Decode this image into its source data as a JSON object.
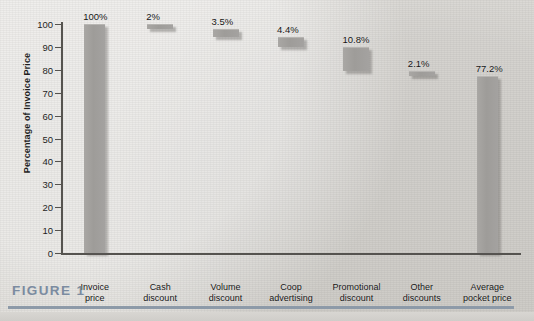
{
  "figure": {
    "caption": "FIGURE 1"
  },
  "chart_data": {
    "type": "bar",
    "title": "",
    "subtitle": "",
    "xlabel": "",
    "ylabel": "Percentage of Invoice Price",
    "ylim": [
      0,
      100
    ],
    "yticks": [
      0,
      10,
      20,
      30,
      40,
      50,
      60,
      70,
      80,
      90,
      100
    ],
    "grid": false,
    "legend": null,
    "waterfall": true,
    "categories": [
      "Invoice\nprice",
      "Cash\ndiscount",
      "Volume\ndiscount",
      "Coop\nadvertising",
      "Promotional\ndiscount",
      "Other\ndiscounts",
      "Average\npocket price"
    ],
    "values": [
      100,
      2,
      3.5,
      4.4,
      10.8,
      2.1,
      77.2
    ],
    "value_labels": [
      "100%",
      "2%",
      "3.5%",
      "4.4%",
      "10.8%",
      "2.1%",
      "77.2%"
    ],
    "bar_bottoms": [
      0,
      98,
      94.5,
      90.1,
      79.3,
      77.2,
      0
    ],
    "bar_tops": [
      100,
      100,
      98,
      94.5,
      90.1,
      79.3,
      77.2
    ],
    "colors": {
      "bar": "#a19f9c",
      "axis": "#55534f",
      "text": "#141414",
      "caption": "#7b8ba0",
      "background": "#dedcd8"
    }
  }
}
